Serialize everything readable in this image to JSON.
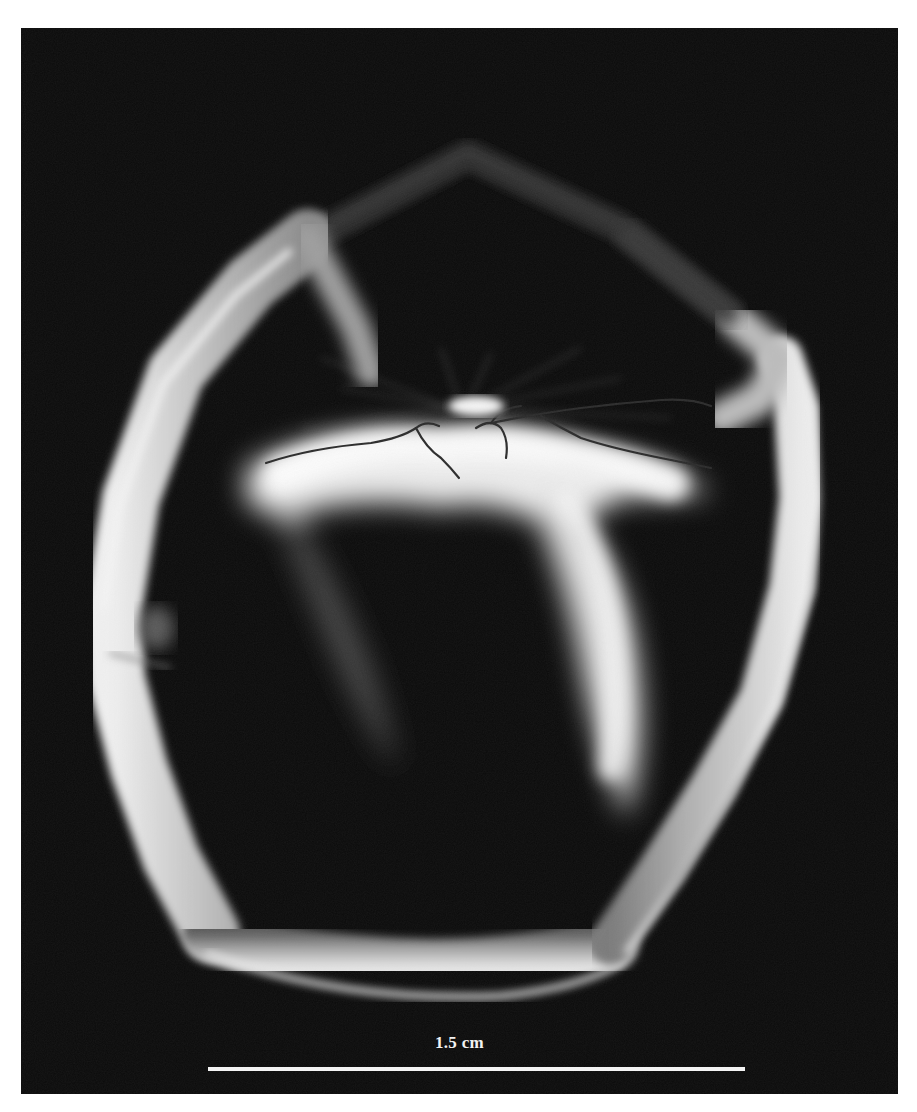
{
  "figure": {
    "background_color": "#0a0a0a",
    "margin_color": "#ffffff",
    "specimen_color": "#dcdcdc"
  },
  "scale_bar": {
    "label": "1.5 cm",
    "color": "#f4f4f4"
  }
}
